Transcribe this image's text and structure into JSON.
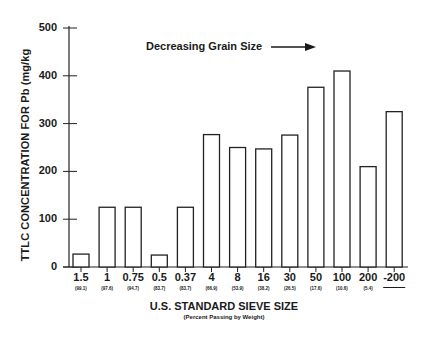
{
  "chart_data": {
    "type": "bar",
    "title": "",
    "ylabel": "TTLC CONCENTRATION FOR Pb  (mg/kg",
    "xlabel": "U.S. STANDARD SIEVE SIZE",
    "xlabel_subtitle": "(Percent Passing by Weight)",
    "annotation": "Decreasing Grain Size",
    "ylim": [
      0,
      500
    ],
    "yticks": [
      0,
      100,
      200,
      300,
      400,
      500
    ],
    "grid": false,
    "legend": null,
    "categories": [
      "1.5",
      "1",
      "0.75",
      "0.5",
      "0.37",
      "4",
      "8",
      "16",
      "30",
      "50",
      "100",
      "200",
      "-200"
    ],
    "category_subtitles": [
      "(99.1)",
      "(97.6)",
      "(94.7)",
      "(83.7)",
      "(83.7)",
      "(66.9)",
      "(53.9)",
      "(38.2)",
      "(26.5)",
      "(17.6)",
      "(10.6)",
      "(5.4)",
      ""
    ],
    "values": [
      27,
      125,
      125,
      25,
      125,
      277,
      250,
      247,
      276,
      376,
      410,
      210,
      325
    ],
    "bar_fill": "#ffffff",
    "bar_stroke": "#222222"
  }
}
